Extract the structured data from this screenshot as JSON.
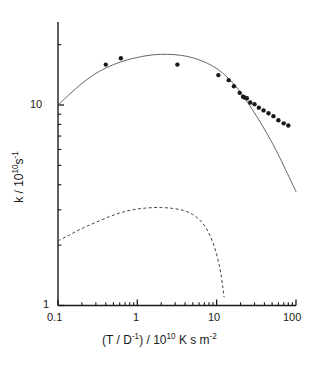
{
  "figure": {
    "background_color": "#ffffff",
    "ink_color": "#1a1a1a"
  },
  "axes": {
    "x": {
      "title_parts": {
        "lead": "(T / D",
        "lead_sup": "-1",
        "mid": ") / 10",
        "mid_sup": "10",
        "tail": " K s m",
        "tail_sup": "-2"
      },
      "title_plain": "(T / D-1) / 1010 K s m-2",
      "tick_labels": [
        "0.1",
        "1",
        "10",
        "100"
      ],
      "scale": "log",
      "range": [
        0.1,
        100
      ]
    },
    "y": {
      "title_parts": {
        "lead": "k / 10",
        "lead_sup": "10",
        "mid": "s",
        "mid_sup": "-1"
      },
      "title_plain": "k / 1010 s-1",
      "tick_labels": [
        "1",
        "10"
      ],
      "scale": "log",
      "range": [
        1,
        20
      ]
    }
  },
  "chart_data": {
    "type": "scatter",
    "title": "",
    "subtitle": "",
    "xlabel": "(T / D^-1) / 10^10 K s m^-2",
    "ylabel": "k / 10^10 s^-1",
    "xscale": "log",
    "yscale": "log",
    "xlim": [
      0.1,
      100
    ],
    "ylim": [
      1,
      20
    ],
    "xticks": [
      0.1,
      1,
      10,
      100
    ],
    "yticks": [
      1,
      10
    ],
    "grid": false,
    "legend": null,
    "legend_position": "none",
    "series": [
      {
        "name": "experimental points",
        "type": "scatter",
        "marker": "filled-circle",
        "color": "#1a1a1a",
        "marker_size": 4.4,
        "points": [
          {
            "x": 0.4,
            "y": 15.9
          },
          {
            "x": 0.62,
            "y": 17.1
          },
          {
            "x": 3.2,
            "y": 15.9
          },
          {
            "x": 10.5,
            "y": 14.1
          },
          {
            "x": 14.2,
            "y": 13.3
          },
          {
            "x": 16.5,
            "y": 12.4
          },
          {
            "x": 19.5,
            "y": 11.5
          },
          {
            "x": 21.5,
            "y": 11.0
          },
          {
            "x": 22.5,
            "y": 10.9
          },
          {
            "x": 24.0,
            "y": 10.8
          },
          {
            "x": 26.5,
            "y": 10.3
          },
          {
            "x": 30.0,
            "y": 10.1
          },
          {
            "x": 34.0,
            "y": 9.7
          },
          {
            "x": 39.0,
            "y": 9.4
          },
          {
            "x": 45.0,
            "y": 9.1
          },
          {
            "x": 52.0,
            "y": 8.8
          },
          {
            "x": 60.0,
            "y": 8.4
          },
          {
            "x": 70.0,
            "y": 8.1
          },
          {
            "x": 80.0,
            "y": 7.9
          }
        ]
      },
      {
        "name": "upper fitted curve",
        "type": "line",
        "style": "solid",
        "color": "#555555",
        "width": 0.9,
        "points": [
          {
            "x": 0.1,
            "y": 10.0
          },
          {
            "x": 0.15,
            "y": 11.6
          },
          {
            "x": 0.22,
            "y": 13.2
          },
          {
            "x": 0.33,
            "y": 14.7
          },
          {
            "x": 0.5,
            "y": 15.9
          },
          {
            "x": 0.75,
            "y": 16.8
          },
          {
            "x": 1.1,
            "y": 17.4
          },
          {
            "x": 1.6,
            "y": 17.8
          },
          {
            "x": 2.4,
            "y": 17.9
          },
          {
            "x": 3.5,
            "y": 17.7
          },
          {
            "x": 5.0,
            "y": 17.2
          },
          {
            "x": 7.0,
            "y": 16.4
          },
          {
            "x": 10.0,
            "y": 15.2
          },
          {
            "x": 14.0,
            "y": 13.6
          },
          {
            "x": 19.0,
            "y": 11.9
          },
          {
            "x": 25.0,
            "y": 10.2
          },
          {
            "x": 33.0,
            "y": 8.6
          },
          {
            "x": 44.0,
            "y": 7.1
          },
          {
            "x": 58.0,
            "y": 5.8
          },
          {
            "x": 75.0,
            "y": 4.7
          },
          {
            "x": 100.0,
            "y": 3.7
          }
        ]
      },
      {
        "name": "lower dashed curve",
        "type": "line",
        "style": "dashed",
        "color": "#444444",
        "width": 1.0,
        "dash": "3,2.4",
        "points": [
          {
            "x": 0.1,
            "y": 2.1
          },
          {
            "x": 0.14,
            "y": 2.25
          },
          {
            "x": 0.2,
            "y": 2.42
          },
          {
            "x": 0.3,
            "y": 2.6
          },
          {
            "x": 0.45,
            "y": 2.78
          },
          {
            "x": 0.65,
            "y": 2.92
          },
          {
            "x": 0.95,
            "y": 3.02
          },
          {
            "x": 1.4,
            "y": 3.07
          },
          {
            "x": 2.0,
            "y": 3.08
          },
          {
            "x": 2.8,
            "y": 3.05
          },
          {
            "x": 3.8,
            "y": 2.98
          },
          {
            "x": 5.0,
            "y": 2.84
          },
          {
            "x": 6.3,
            "y": 2.64
          },
          {
            "x": 7.6,
            "y": 2.38
          },
          {
            "x": 8.8,
            "y": 2.1
          },
          {
            "x": 9.9,
            "y": 1.82
          },
          {
            "x": 10.8,
            "y": 1.58
          },
          {
            "x": 11.5,
            "y": 1.38
          },
          {
            "x": 12.0,
            "y": 1.22
          },
          {
            "x": 12.4,
            "y": 1.1
          }
        ]
      }
    ]
  }
}
